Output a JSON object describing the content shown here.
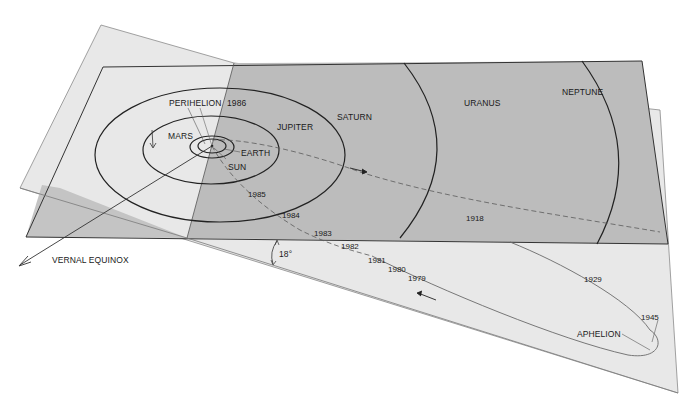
{
  "diagram": {
    "colors": {
      "background": "#ffffff",
      "comet_plane": "#e6e6e6",
      "ecliptic_plane": "#bdbdbd",
      "ecliptic_overlap": "#c8c8c8",
      "orbit_line": "#222222",
      "comet_path": "#5a5a5a"
    },
    "planets": [
      {
        "name": "MARS",
        "label": "MARS"
      },
      {
        "name": "EARTH",
        "label": "EARTH"
      },
      {
        "name": "JUPITER",
        "label": "JUPITER"
      },
      {
        "name": "SATURN",
        "label": "SATURN"
      },
      {
        "name": "URANUS",
        "label": "URANUS"
      },
      {
        "name": "NEPTUNE",
        "label": "NEPTUNE"
      }
    ],
    "sun_label": "SUN",
    "perihelion": {
      "label": "PERIHELION",
      "year": "1986"
    },
    "aphelion": {
      "label": "APHELION"
    },
    "vernal_equinox_label": "VERNAL EQUINOX",
    "inclination_label": "18°",
    "comet_years": [
      "1985",
      "1984",
      "1983",
      "1982",
      "1981",
      "1980",
      "1979",
      "1918",
      "1929",
      "1945"
    ]
  }
}
